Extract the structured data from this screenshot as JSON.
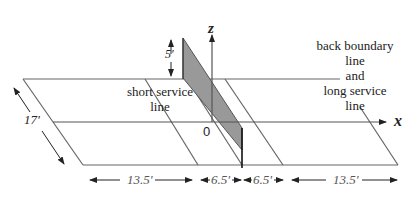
{
  "diagram": {
    "axes": {
      "z_label": "z",
      "x_label": "x",
      "origin_label": "0"
    },
    "labels": {
      "short_service": [
        "short service",
        "line"
      ],
      "back_boundary": [
        "back boundary",
        "line",
        "and",
        "long service",
        "line"
      ]
    },
    "dimensions": {
      "net_height": "5'",
      "court_width": "17'",
      "segments": [
        "13.5'",
        "6.5'",
        "6.5'",
        "13.5'"
      ]
    },
    "colors": {
      "line": "#555555",
      "net_fill": "#999999",
      "text": "#222222"
    }
  }
}
